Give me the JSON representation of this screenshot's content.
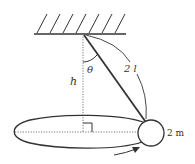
{
  "diagram": {
    "labels": {
      "angle": "θ",
      "height": "h",
      "string_length": "2 l",
      "mass": "2 m"
    },
    "colors": {
      "line": "#333333",
      "dotted": "#777777",
      "background": "#ffffff"
    },
    "elements": {
      "ceiling": "hatched fixed support",
      "string": "taut string from pivot to bob",
      "vertical_axis": "dotted vertical line of height h",
      "orbit": "horizontal circular path (ellipse in perspective)",
      "radius_line": "dotted horizontal radius",
      "right_angle_marker": "right angle between axis and radius",
      "bob": "ball of mass 2m",
      "rotation_arrow": "direction of revolution"
    }
  }
}
